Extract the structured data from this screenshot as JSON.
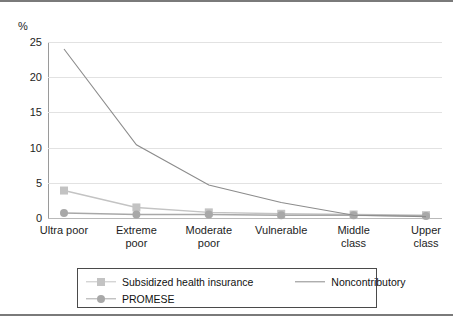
{
  "chart_data": {
    "type": "line",
    "title": "",
    "subtitle": "",
    "xlabel": "",
    "ylabel": "%",
    "unit_label": "%",
    "ylim": [
      0,
      25
    ],
    "yticks": [
      0,
      5,
      10,
      15,
      20,
      25
    ],
    "ytick_labels": [
      "0",
      "5",
      "10",
      "15",
      "20",
      "25"
    ],
    "grid": true,
    "legend_position": "bottom",
    "categories": [
      "Ultra poor",
      "Extreme poor",
      "Moderate poor",
      "Vulnerable",
      "Middle class",
      "Upper class"
    ],
    "category_lines": [
      [
        "Ultra poor"
      ],
      [
        "Extreme",
        "poor"
      ],
      [
        "Moderate",
        "poor"
      ],
      [
        "Vulnerable"
      ],
      [
        "Middle",
        "class"
      ],
      [
        "Upper",
        "class"
      ]
    ],
    "series": [
      {
        "name": "Subsidized health insurance",
        "marker": "square",
        "color": "#c3c3c3",
        "values": [
          3.9,
          1.5,
          0.8,
          0.6,
          0.5,
          0.4
        ]
      },
      {
        "name": "Noncontributory",
        "marker": "none",
        "color": "#8c8c8c",
        "values": [
          24.0,
          10.4,
          4.7,
          2.2,
          0.4,
          0.2
        ]
      },
      {
        "name": "PROMESE",
        "marker": "circle",
        "color": "#a8a8a8",
        "values": [
          0.7,
          0.5,
          0.5,
          0.4,
          0.4,
          0.3
        ]
      }
    ]
  },
  "legend": {
    "items": [
      {
        "label": "Subsidized health insurance",
        "marker": "square",
        "color": "#c3c3c3"
      },
      {
        "label": "Noncontributory",
        "marker": "none",
        "color": "#8c8c8c"
      },
      {
        "label": "PROMESE",
        "marker": "circle",
        "color": "#a8a8a8"
      }
    ]
  },
  "colors": {
    "subsidized": "#c3c3c3",
    "noncontributory": "#8c8c8c",
    "promese": "#a8a8a8",
    "grid": "#e2e2e2",
    "axis": "#9a9a9a",
    "frame": "#7a7a7a",
    "text": "#1d1d1d"
  }
}
